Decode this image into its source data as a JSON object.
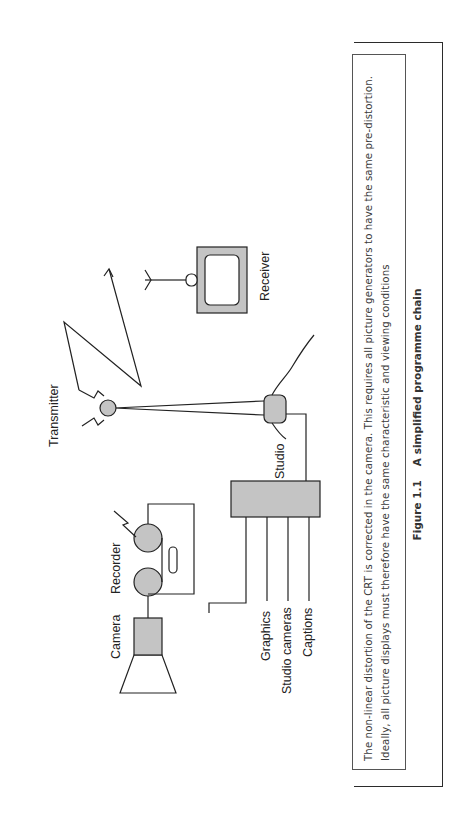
{
  "figure": {
    "number": "Figure 1.1",
    "title": "A simplified programme chain",
    "caption": "The non-linear distortion of the CRT is corrected in the camera. This requires all picture generators to have the same pre-distortion. Ideally, all picture displays must therefore have the same characteristic and viewing conditions"
  },
  "diagram": {
    "labels": {
      "camera": "Camera",
      "recorder": "Recorder",
      "studio": "Studio",
      "transmitter": "Transmitter",
      "receiver": "Receiver",
      "inputs": [
        "Graphics",
        "Studio cameras",
        "Captions"
      ]
    },
    "colors": {
      "fill_grey": "#c4c4c4",
      "stroke": "#222222"
    },
    "orientation": "rotated 90 degrees counter-clockwise"
  }
}
